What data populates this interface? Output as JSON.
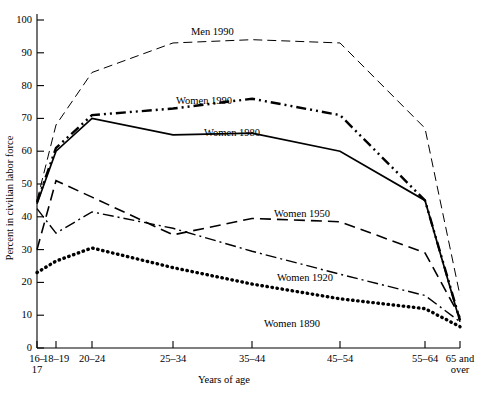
{
  "chart_data": {
    "type": "line",
    "title": "",
    "xlabel": "Years of age",
    "ylabel": "Percent in civilian labor force",
    "categories": [
      "16–\n17",
      "18–19",
      "20–24",
      "25–34",
      "35–44",
      "45–54",
      "55–64",
      "65 and\nover"
    ],
    "x_tick_labels": [
      "16–",
      "18–19",
      "20–24",
      "25–34",
      "35–44",
      "45–54",
      "55–64",
      "65 and"
    ],
    "x_tick_labels_line2": [
      "17",
      "",
      "",
      "",
      "",
      "",
      "",
      "over"
    ],
    "y_ticks": [
      0,
      10,
      20,
      30,
      40,
      50,
      60,
      70,
      80,
      90,
      100
    ],
    "ylim": [
      0,
      100
    ],
    "grid": false,
    "legend_position": "inline-annotations",
    "series": [
      {
        "name": "Men 1990",
        "label": "Men 1990",
        "style": "dashed",
        "color": "#000000",
        "values": [
          45,
          68,
          84,
          93,
          94,
          93,
          67,
          16
        ]
      },
      {
        "name": "Women 1990",
        "label": "Women 1990",
        "style": "dash-dot-dot",
        "color": "#000000",
        "values": [
          44.5,
          61,
          71,
          73,
          76,
          71,
          45,
          8.5
        ]
      },
      {
        "name": "Women 1980",
        "label": "Women 1980",
        "style": "solid",
        "color": "#000000",
        "values": [
          44,
          60,
          70,
          65,
          65.5,
          60,
          45,
          8
        ]
      },
      {
        "name": "Women 1950",
        "label": "Women 1950",
        "style": "long-dash",
        "color": "#000000",
        "values": [
          30,
          51,
          46,
          34.5,
          39.5,
          38.5,
          29,
          9.5
        ]
      },
      {
        "name": "Women 1920",
        "label": "Women 1920",
        "style": "dash-dot",
        "color": "#000000",
        "values": [
          42.5,
          35,
          41.5,
          36.5,
          29.5,
          22.5,
          16,
          8
        ]
      },
      {
        "name": "Women 1890",
        "label": "Women 1890",
        "style": "dotted",
        "color": "#000000",
        "values": [
          23,
          26.5,
          30.5,
          24.5,
          19.5,
          15,
          12,
          6.5
        ]
      }
    ]
  },
  "axis": {
    "y_label": "Percent in civilian labor force",
    "x_label": "Years of age"
  },
  "y_tick_texts": [
    "100",
    "90",
    "80",
    "70",
    "60",
    "50",
    "40",
    "30",
    "20",
    "10",
    "0"
  ],
  "series_labels": {
    "men_1990": "Men 1990",
    "women_1990": "Women 1990",
    "women_1980": "Women 1980",
    "women_1950": "Women 1950",
    "women_1920": "Women 1920",
    "women_1890": "Women 1890"
  }
}
